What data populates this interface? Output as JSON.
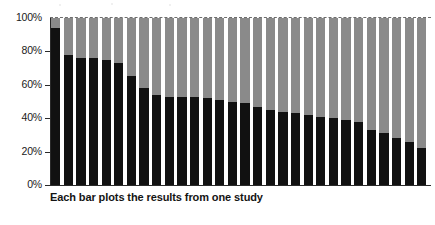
{
  "chart_data": {
    "type": "bar",
    "subtype": "stacked-100-percent",
    "title": "",
    "subtitle": "",
    "xlabel": "",
    "ylabel": "",
    "caption": "Each bar plots the results from one study",
    "ylim": [
      0,
      100
    ],
    "y_ticks": [
      "0%",
      "20%",
      "40%",
      "60%",
      "80%",
      "100%"
    ],
    "y_tick_values": [
      0,
      20,
      40,
      60,
      80,
      100
    ],
    "grid": false,
    "top_rule_dashed": true,
    "legend": [],
    "legend_position": "none",
    "x_tick_labels": [],
    "categories": [
      "1",
      "2",
      "3",
      "4",
      "5",
      "6",
      "7",
      "8",
      "9",
      "10",
      "11",
      "12",
      "13",
      "14",
      "15",
      "16",
      "17",
      "18",
      "19",
      "20",
      "21",
      "22",
      "23",
      "24",
      "25",
      "26",
      "27",
      "28",
      "29",
      "30"
    ],
    "series": [
      {
        "name": "lower-segment",
        "color": "#111111",
        "values": [
          94,
          78,
          76,
          76,
          75,
          73,
          65,
          58,
          54,
          53,
          53,
          53,
          52,
          51,
          50,
          49,
          47,
          45,
          44,
          43,
          42,
          41,
          40,
          39,
          38,
          33,
          31,
          28,
          26,
          22
        ]
      },
      {
        "name": "upper-segment",
        "color": "#8a8a8a",
        "values": [
          6,
          22,
          24,
          24,
          25,
          27,
          35,
          42,
          46,
          47,
          47,
          47,
          48,
          49,
          50,
          51,
          53,
          55,
          56,
          57,
          58,
          59,
          60,
          61,
          62,
          67,
          69,
          72,
          74,
          78
        ]
      }
    ],
    "bar_count": 30
  },
  "colors": {
    "lower_segment": "#111111",
    "upper_segment": "#8a8a8a",
    "axis": "#2a2a2a",
    "text": "#1a1a1a",
    "background": "#ffffff"
  }
}
